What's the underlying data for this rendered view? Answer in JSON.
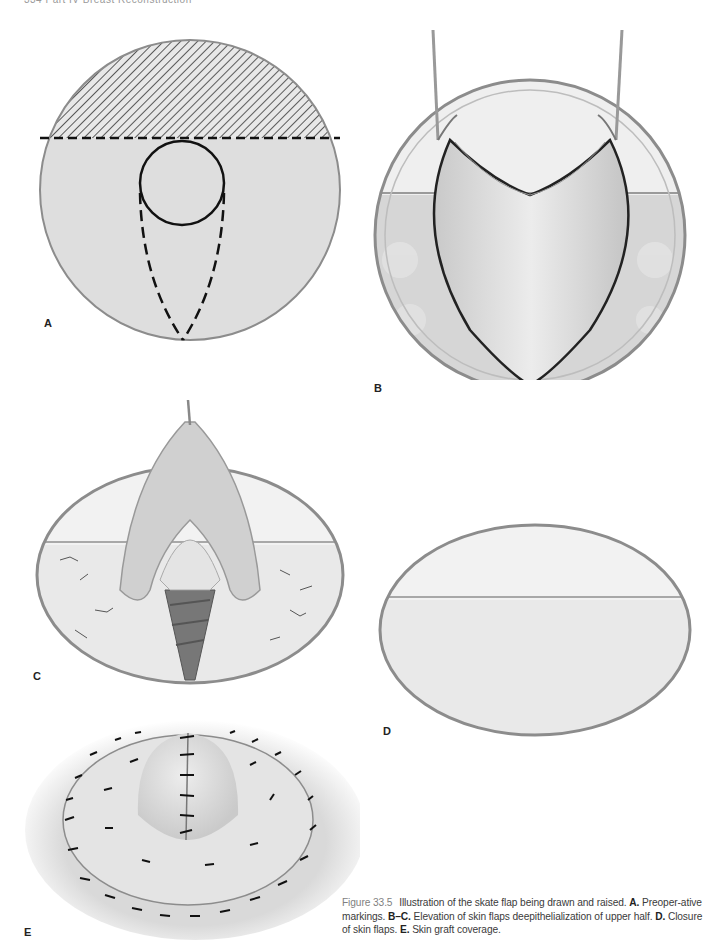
{
  "page": {
    "running_head": "334     Part IV   Breast Reconstruction"
  },
  "panels": [
    {
      "id": "A",
      "label": "A",
      "description": "Preoperative markings: circular area with hatched upper half above dashed line, solid circle (nipple site) and dashed teardrop flap outline"
    },
    {
      "id": "B",
      "label": "B",
      "description": "Skin flaps elevated with two hooks; upper half deepithelialized"
    },
    {
      "id": "C",
      "label": "C",
      "description": "Elevation of skin flaps with deepithelialization of upper half; muscle exposed below"
    },
    {
      "id": "D",
      "label": "D",
      "description": "Closure of skin flaps with sutures"
    },
    {
      "id": "E",
      "label": "E",
      "description": "Skin graft coverage with circumferential sutures"
    }
  ],
  "caption": {
    "figure_number": "Figure 33.5",
    "text_1": "Illustration of the skate flap being drawn and raised.",
    "bold_A": "A.",
    "text_A": "Preoper-ative markings.",
    "bold_BC": "B–C.",
    "text_BC": "Elevation of skin flaps deepithelialization of upper half.",
    "bold_D": "D.",
    "text_D": "Closure of skin flaps.",
    "bold_E": "E.",
    "text_E": "Skin graft coverage."
  },
  "colors": {
    "page_bg": "#ffffff",
    "skin_fill": "#dcdcdc",
    "outline": "#8c8c8c",
    "marking_line": "#111111",
    "caption_text": "#3b3b3b",
    "figure_number": "#7f7f7f"
  }
}
